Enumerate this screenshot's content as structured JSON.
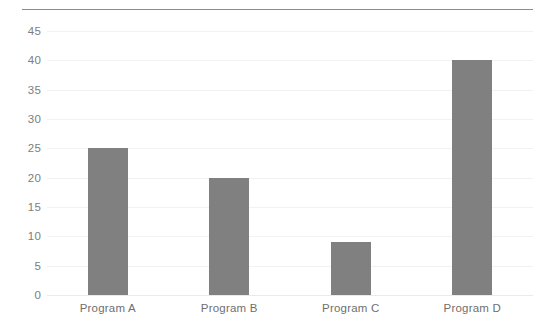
{
  "chart_data": {
    "type": "bar",
    "title": "",
    "subtitle": "",
    "xlabel": "",
    "ylabel": "",
    "categories": [
      "Program A",
      "Program B",
      "Program C",
      "Program D"
    ],
    "values": [
      25,
      20,
      9,
      40
    ],
    "series": [
      {
        "name": "",
        "values": [
          25,
          20,
          9,
          40
        ]
      }
    ],
    "ylim": [
      0,
      45
    ],
    "ytick_labels": [
      "0",
      "5",
      "10",
      "15",
      "20",
      "25",
      "30",
      "35",
      "40",
      "45"
    ],
    "ytick_values": [
      0,
      5,
      10,
      15,
      20,
      25,
      30,
      35,
      40,
      45
    ],
    "grid": true,
    "grid_axis": "y",
    "legend": false,
    "legend_position": "none",
    "bar_color": "#808080",
    "gridline_color": "#f2f2f2",
    "tick_label_color": "#7d7d7d",
    "top_rule_color": "#8d8d8d",
    "background_color": "#ffffff"
  }
}
